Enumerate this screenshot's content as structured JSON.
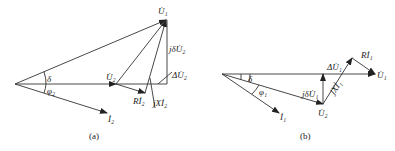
{
  "figure_a": {
    "caption": "(a)",
    "labels": {
      "U1": "U̇₁",
      "U2": "U̇₂",
      "I2": "İ₂",
      "delta": "δ",
      "phi2": "φ₂",
      "RI2": "Rİ₂",
      "jXI2": "jXİ₂",
      "jdU2": "jδU̇₂",
      "dU2": "ΔU̇₂"
    }
  },
  "figure_b": {
    "caption": "(b)",
    "labels": {
      "U1": "U̇₁",
      "U2": "U̇₂",
      "I1": "İ₁",
      "delta": "δ",
      "phi1": "φ₁",
      "RI1": "Rİ₁",
      "jXI1": "jXİ₁",
      "jdU1": "jδU̇₁",
      "dU1": "ΔU̇₁"
    }
  },
  "colors": {
    "line": "#333333",
    "text": "#222222",
    "background": "#ffffff"
  }
}
